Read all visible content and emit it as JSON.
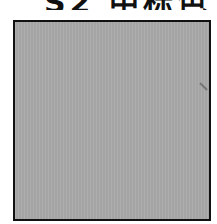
{
  "header": {
    "text": "S2 中标色",
    "note_visible": "clipped at top edge"
  },
  "swatch": {
    "fill_color": "#a9a9a9",
    "border_color": "#111111"
  }
}
